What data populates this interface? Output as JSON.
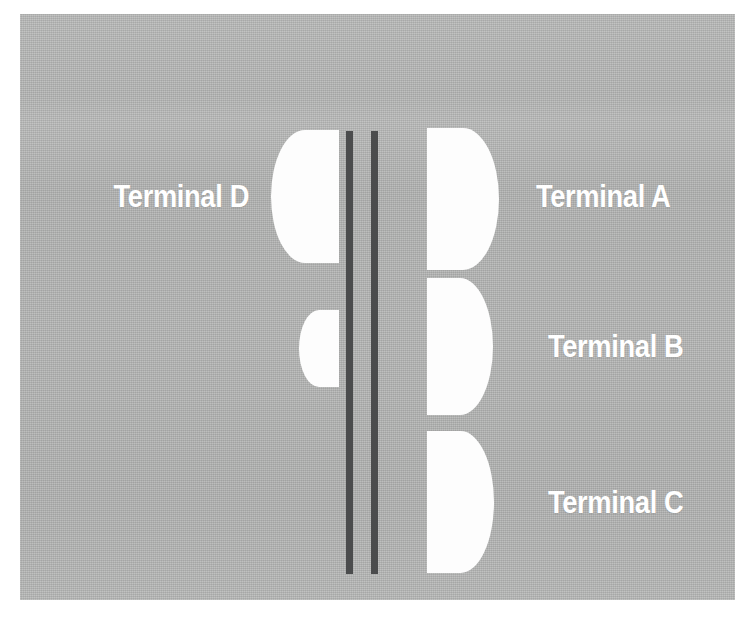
{
  "figure": {
    "name": "airport-terminal-layout-diagram",
    "background_color": "#b4b5b4",
    "page_color": "#ffffff",
    "shape_color": "#fdfdfd",
    "bar_color": "#4b4c4d",
    "label_color": "#ffffff"
  },
  "labels": [
    {
      "id": "terminal-d",
      "text": "Terminal D",
      "side": "left",
      "align": "align-right",
      "left": 33,
      "top": 167,
      "width": 196
    },
    {
      "id": "terminal-a",
      "text": "Terminal A",
      "side": "right",
      "align": "align-left",
      "left": 516,
      "top": 167,
      "width": 196
    },
    {
      "id": "terminal-b",
      "text": "Terminal B",
      "side": "right",
      "align": "align-left",
      "left": 528,
      "top": 317,
      "width": 196
    },
    {
      "id": "terminal-c",
      "text": "Terminal C",
      "side": "right",
      "align": "align-left",
      "left": 528,
      "top": 473,
      "width": 196
    }
  ],
  "shapes": [
    {
      "id": "concourse-d",
      "facing": "face-left",
      "left": 251,
      "top": 116,
      "width": 68,
      "height": 133
    },
    {
      "id": "concourse-d-small",
      "facing": "face-left",
      "left": 279,
      "top": 296,
      "width": 40,
      "height": 77
    },
    {
      "id": "concourse-a",
      "facing": "face-right",
      "left": 407,
      "top": 114,
      "width": 72,
      "height": 142
    },
    {
      "id": "concourse-b",
      "facing": "face-right",
      "left": 407,
      "top": 264,
      "width": 66,
      "height": 137
    },
    {
      "id": "concourse-c",
      "facing": "face-right",
      "left": 407,
      "top": 417,
      "width": 67,
      "height": 142
    }
  ],
  "bars": [
    {
      "id": "runway-bar-west",
      "left": 326,
      "top": 117,
      "width": 7,
      "height": 443
    },
    {
      "id": "runway-bar-east",
      "left": 351,
      "top": 117,
      "width": 7,
      "height": 443
    }
  ]
}
